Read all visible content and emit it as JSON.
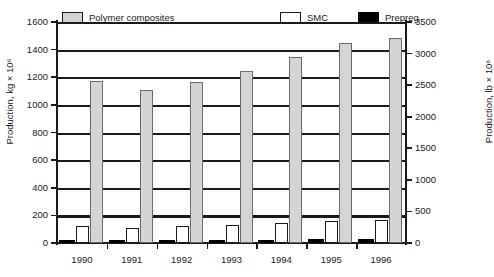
{
  "chart_data": {
    "type": "bar",
    "title": "",
    "subtitle": "",
    "xlabel": "",
    "ylabel": "Production, kg × 10⁶",
    "ylabel_secondary": "Production, lb × 10⁶",
    "categories": [
      "1990",
      "1991",
      "1992",
      "1993",
      "1994",
      "1995",
      "1996"
    ],
    "series": [
      {
        "name": "Polymer composites",
        "color": "#d4d4d4",
        "values": [
          1175,
          1110,
          1165,
          1245,
          1345,
          1450,
          1485
        ]
      },
      {
        "name": "SMC",
        "color": "#ffffff",
        "values": [
          125,
          110,
          125,
          130,
          145,
          160,
          170
        ]
      },
      {
        "name": "Prepreg",
        "color": "#000000",
        "values": [
          20,
          22,
          22,
          22,
          24,
          26,
          28
        ]
      }
    ],
    "ylim": [
      0,
      1600
    ],
    "ylim_secondary": [
      0,
      3500
    ],
    "yticks": [
      0,
      200,
      400,
      600,
      800,
      1000,
      1200,
      1400,
      1600
    ],
    "yticks_secondary": [
      0,
      500,
      1000,
      1500,
      2000,
      2500,
      3000,
      3500
    ],
    "ytick_labels": [
      "0",
      "200",
      "400",
      "600",
      "800",
      "1000",
      "1200",
      "1400",
      "1600"
    ],
    "ytick_labels_secondary": [
      "0",
      "500",
      "1000",
      "1500",
      "2000",
      "2500",
      "3000",
      "3500"
    ],
    "grid": true,
    "grid_axis": "y",
    "legend_position": "top",
    "legend": [
      "Polymer composites",
      "SMC",
      "Prepreg"
    ]
  },
  "legend": {
    "items": [
      {
        "label": "Polymer composites",
        "swatch": "legend-swatch-grey"
      },
      {
        "label": "SMC",
        "swatch": "legend-swatch-white"
      },
      {
        "label": "Prepreg",
        "swatch": "legend-swatch-black"
      }
    ]
  },
  "axes": {
    "left_title": "Production, kg × 10⁶",
    "right_title": "Production, lb × 10⁶"
  }
}
